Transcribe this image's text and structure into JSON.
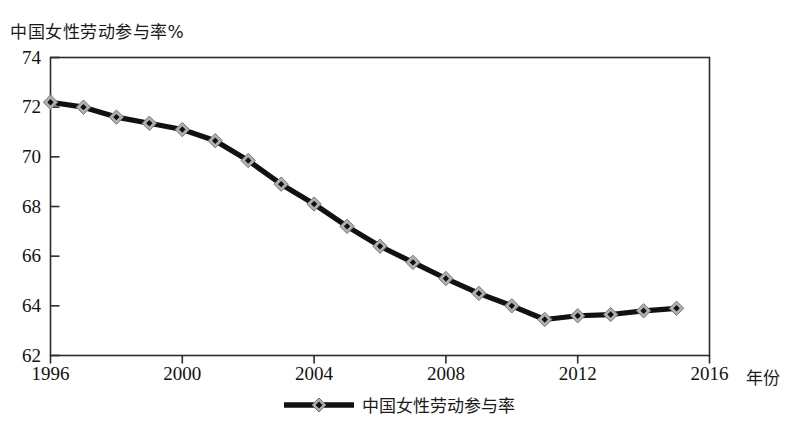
{
  "chart_data": {
    "type": "line",
    "title": "中国女性劳动参与率%",
    "xlabel": "年份",
    "ylabel": "中国女性劳动参与率%",
    "xlim": [
      1996,
      2016
    ],
    "ylim": [
      62,
      74
    ],
    "xticks": [
      "1996",
      "2000",
      "2004",
      "2008",
      "2012",
      "2016"
    ],
    "yticks": [
      "62",
      "64",
      "66",
      "68",
      "70",
      "72",
      "74"
    ],
    "grid": false,
    "legend_position": "bottom-center",
    "marker": "diamond",
    "line_color": "#111111",
    "marker_face_color": "#b0b0b0",
    "series": [
      {
        "name": "中国女性劳动参与率",
        "x": [
          1996,
          1997,
          1998,
          1999,
          2000,
          2001,
          2002,
          2003,
          2004,
          2005,
          2006,
          2007,
          2008,
          2009,
          2010,
          2011,
          2012,
          2013,
          2014,
          2015
        ],
        "values": [
          72.2,
          72.0,
          71.6,
          71.35,
          71.1,
          70.65,
          69.85,
          68.9,
          68.1,
          67.2,
          66.4,
          65.75,
          65.1,
          64.5,
          64.0,
          63.45,
          63.6,
          63.65,
          63.8,
          63.9
        ]
      }
    ]
  },
  "legend": {
    "entries": [
      {
        "label": "中国女性劳动参与率"
      }
    ]
  }
}
